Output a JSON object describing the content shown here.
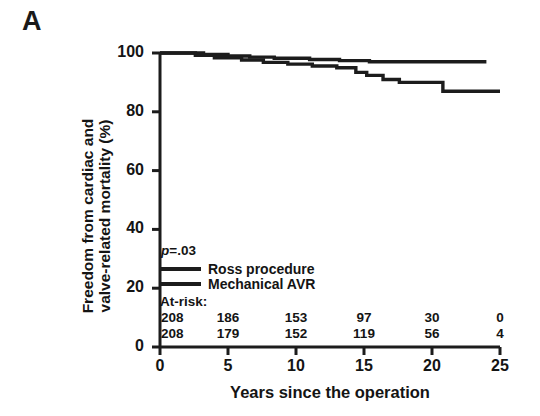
{
  "panel": {
    "label": "A"
  },
  "chart_data": {
    "type": "line",
    "title": "",
    "xlabel": "Years since the operation",
    "ylabel": "Freedom from cardiac and valve-related mortality (%)",
    "ylabel_lines": [
      "Freedom from cardiac and",
      "valve-related mortality (%)"
    ],
    "xlim": [
      0,
      25
    ],
    "ylim": [
      0,
      100
    ],
    "xticks": [
      0,
      5,
      10,
      15,
      20,
      25
    ],
    "yticks": [
      0,
      20,
      40,
      60,
      80,
      100
    ],
    "xtick_labels": [
      "0",
      "5",
      "10",
      "15",
      "20",
      "25"
    ],
    "ytick_labels": [
      "0",
      "20",
      "40",
      "60",
      "80",
      "100"
    ],
    "grid": false,
    "legend_position": "inside-lower-left",
    "annotations": [
      {
        "name": "p-value",
        "text": "p=.03",
        "italic_prefix": "p",
        "rest": "=.03"
      }
    ],
    "series": [
      {
        "name": "Ross procedure",
        "color": "#1c1c1c",
        "step_points": [
          [
            0,
            100
          ],
          [
            3.2,
            100
          ],
          [
            3.2,
            99.5
          ],
          [
            5.0,
            99.5
          ],
          [
            5.0,
            99.0
          ],
          [
            6.6,
            99.0
          ],
          [
            6.6,
            98.6
          ],
          [
            8.4,
            98.6
          ],
          [
            8.4,
            98.2
          ],
          [
            11.0,
            98.2
          ],
          [
            11.0,
            97.8
          ],
          [
            13.2,
            97.8
          ],
          [
            13.2,
            97.4
          ],
          [
            15.4,
            97.4
          ],
          [
            15.4,
            97.0
          ],
          [
            24.0,
            97.0
          ]
        ]
      },
      {
        "name": "Mechanical AVR",
        "color": "#1c1c1c",
        "step_points": [
          [
            0,
            100
          ],
          [
            2.6,
            100
          ],
          [
            2.6,
            99.2
          ],
          [
            4.0,
            99.2
          ],
          [
            4.0,
            98.4
          ],
          [
            6.0,
            98.4
          ],
          [
            6.0,
            97.6
          ],
          [
            7.6,
            97.6
          ],
          [
            7.6,
            96.8
          ],
          [
            9.4,
            96.8
          ],
          [
            9.4,
            96.2
          ],
          [
            11.2,
            96.2
          ],
          [
            11.2,
            95.6
          ],
          [
            13.0,
            95.6
          ],
          [
            13.0,
            95.0
          ],
          [
            14.4,
            95.0
          ],
          [
            14.4,
            93.4
          ],
          [
            15.2,
            93.4
          ],
          [
            15.2,
            92.4
          ],
          [
            16.4,
            92.4
          ],
          [
            16.4,
            91.0
          ],
          [
            17.6,
            91.0
          ],
          [
            17.6,
            90.0
          ],
          [
            20.8,
            90.0
          ],
          [
            20.8,
            87.0
          ],
          [
            25.0,
            87.0
          ]
        ]
      }
    ],
    "at_risk": {
      "title": "At-risk:",
      "times": [
        0,
        5,
        10,
        15,
        20,
        25
      ],
      "rows": [
        {
          "series": "Ross procedure",
          "counts": [
            "208",
            "186",
            "153",
            "97",
            "30",
            "0"
          ]
        },
        {
          "series": "Mechanical AVR",
          "counts": [
            "208",
            "179",
            "152",
            "119",
            "56",
            "4"
          ]
        }
      ]
    }
  },
  "legend": {
    "items": [
      {
        "label": "Ross procedure",
        "color": "#1c1c1c"
      },
      {
        "label": "Mechanical AVR",
        "color": "#1c1c1c"
      }
    ]
  }
}
